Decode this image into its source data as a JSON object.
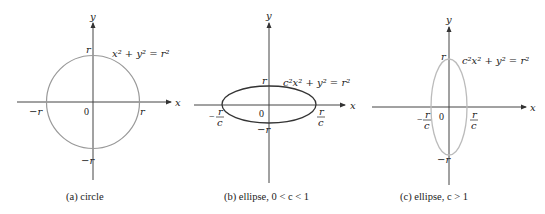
{
  "panels": [
    {
      "id": "a",
      "caption": "(a) circle",
      "equation": "x² + y² = r²",
      "axis_x": "x",
      "axis_y": "y",
      "origin": "0",
      "tick_top": "r",
      "tick_bottom": "−r",
      "tick_left": "−r",
      "tick_right": "r",
      "curve_color": "#999999"
    },
    {
      "id": "b",
      "caption": "(b) ellipse, 0 < c < 1",
      "equation": "c²x² + y² = r²",
      "axis_x": "x",
      "axis_y": "y",
      "origin": "0",
      "tick_top": "r",
      "tick_bottom": "−r",
      "tick_left_num": "r",
      "tick_left_den": "c",
      "tick_left_sign": "−",
      "tick_right_num": "r",
      "tick_right_den": "c",
      "curve_color": "#333333"
    },
    {
      "id": "c",
      "caption": "(c) ellipse,  c > 1",
      "equation": "c²x² + y² = r²",
      "axis_x": "x",
      "axis_y": "y",
      "origin": "0",
      "tick_top": "r",
      "tick_bottom": "−r",
      "tick_left_num": "r",
      "tick_left_den": "c",
      "tick_left_sign": "−",
      "tick_right_num": "r",
      "tick_right_den": "c",
      "curve_color": "#bbbbbb"
    }
  ]
}
